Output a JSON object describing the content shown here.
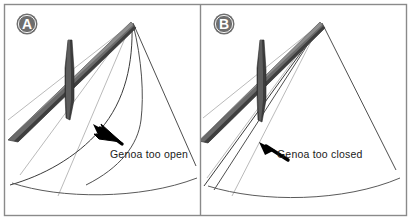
{
  "figure": {
    "width": 411,
    "height": 220,
    "background_color": "#ffffff",
    "border_color": "#8a8a8a",
    "panel_divider_color": "#8a8a8a"
  },
  "colors": {
    "badge_fill": "#6e6e6e",
    "badge_text": "#ffffff",
    "spreader_dark": "#4a4a4a",
    "spreader_mid": "#6b6b6b",
    "spreader_light": "#8f8f8f",
    "mast_dark": "#3c3c3c",
    "sail_line": "#3a3a3a",
    "rig_line": "#9a9a9a",
    "arrow_fill": "#000000",
    "text_color": "#1a1a1a"
  },
  "panels": [
    {
      "id": "panel-a",
      "badge_label": "A",
      "callout": {
        "text": "Genoa too open",
        "x": 110,
        "y": 155
      },
      "leech_shape": "curved-open",
      "description": "Genoa leech falls off to leeward, sail curves away from the spreader"
    },
    {
      "id": "panel-b",
      "badge_label": "B",
      "callout": {
        "text": "Genoa too closed",
        "x": 277,
        "y": 155
      },
      "leech_shape": "straight-closed",
      "description": "Genoa leech is hooked in tight against the spreader"
    }
  ],
  "elements": {
    "mast": "mast",
    "spreader": "spreader",
    "genoa_leech": "genoa-leech",
    "forestay": "forestay",
    "shroud": "shroud",
    "deck_curve": "deck-curve",
    "arrow": "callout-arrow"
  }
}
